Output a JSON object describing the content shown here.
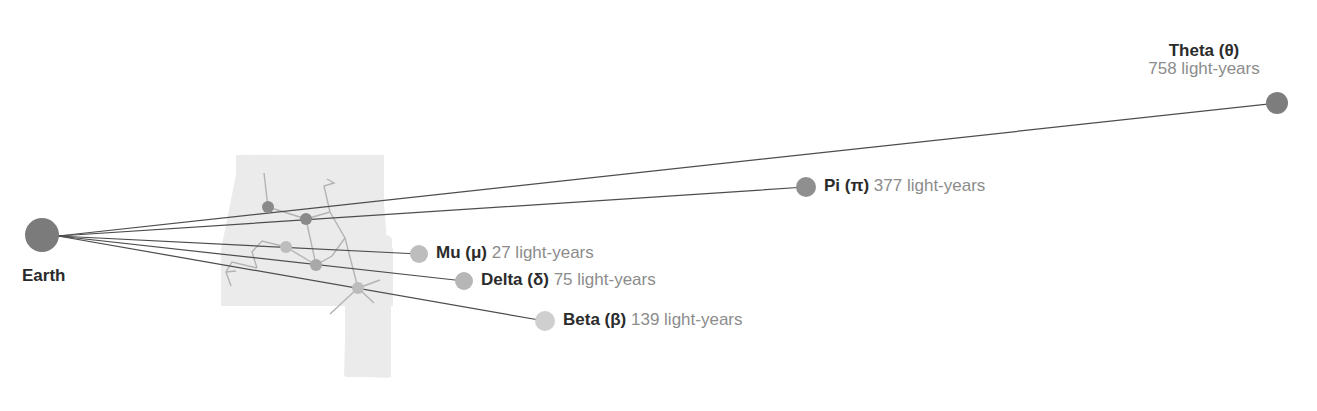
{
  "diagram": {
    "origin": {
      "name": "Earth",
      "label": "Earth",
      "x": 42,
      "y": 235,
      "radius": 17,
      "color": "#7b7b7b",
      "label_x": 22,
      "label_y": 266
    },
    "units": "light-years",
    "background_field": {
      "name": "constellation-region",
      "fill": "#ebebeb"
    },
    "stars": [
      {
        "id": "theta",
        "name": "Theta (θ)",
        "distance_value": 758,
        "distance_text": "758 light-years",
        "x": 1277,
        "y": 103,
        "radius": 11,
        "color": "#7d7d7d",
        "label_layout": "stacked",
        "label_x": 1145,
        "label_y": 42,
        "label_width": 118
      },
      {
        "id": "pi",
        "name": "Pi (π)",
        "distance_value": 377,
        "distance_text": "377 light-years",
        "x": 806,
        "y": 187,
        "radius": 10,
        "color": "#8f8f8f",
        "label_layout": "inline",
        "label_x": 824,
        "label_y": 177
      },
      {
        "id": "mu",
        "name": "Mu (μ)",
        "distance_value": 27,
        "distance_text": "27 light-years",
        "x": 419,
        "y": 254,
        "radius": 9,
        "color": "#bdbdbd",
        "label_layout": "inline",
        "label_x": 436,
        "label_y": 244
      },
      {
        "id": "delta",
        "name": "Delta (δ)",
        "distance_value": 75,
        "distance_text": "75 light-years",
        "x": 464,
        "y": 281,
        "radius": 9,
        "color": "#b6b6b6",
        "label_layout": "inline",
        "label_x": 481,
        "label_y": 271
      },
      {
        "id": "beta",
        "name": "Beta (β)",
        "distance_value": 139,
        "distance_text": "139 light-years",
        "x": 545,
        "y": 321,
        "radius": 10,
        "color": "#cfcfcf",
        "label_layout": "inline",
        "label_x": 563,
        "label_y": 311
      }
    ],
    "field_stars": [
      {
        "id": "field-1",
        "x": 268,
        "y": 207,
        "radius": 6,
        "color": "#8a8a8a"
      },
      {
        "id": "field-2",
        "x": 306,
        "y": 219,
        "radius": 6,
        "color": "#8a8a8a"
      },
      {
        "id": "field-3",
        "x": 286,
        "y": 247,
        "radius": 6,
        "color": "#bdbdbd"
      },
      {
        "id": "field-4",
        "x": 316,
        "y": 265,
        "radius": 6,
        "color": "#a8a8a8"
      },
      {
        "id": "field-5",
        "x": 358,
        "y": 288,
        "radius": 6,
        "color": "#bcbcbc"
      }
    ],
    "chart_data": {
      "type": "scatter",
      "title": "Distances to nearby stars from Earth",
      "xlabel": "",
      "ylabel": "",
      "categories": [
        "Mu (μ)",
        "Delta (δ)",
        "Beta (β)",
        "Pi (π)",
        "Theta (θ)"
      ],
      "values": [
        27,
        75,
        139,
        377,
        758
      ],
      "unit": "light-years",
      "origin_label": "Earth",
      "legend": "none",
      "grid": false
    }
  }
}
